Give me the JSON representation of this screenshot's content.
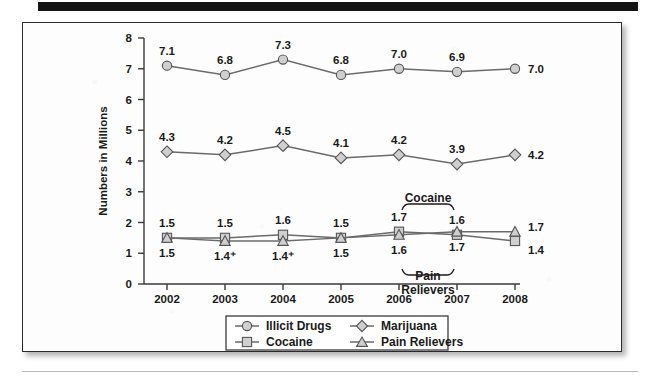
{
  "figure": {
    "alt_name": "drug-use-line-chart"
  },
  "chart_data": {
    "type": "line",
    "title": "",
    "xlabel": "",
    "ylabel": "Numbers in Millions",
    "categories": [
      "2002",
      "2003",
      "2004",
      "2005",
      "2006",
      "2007",
      "2008"
    ],
    "ylim": [
      0,
      8
    ],
    "yticks": [
      "0",
      "1",
      "2",
      "3",
      "4",
      "5",
      "6",
      "7",
      "8"
    ],
    "grid": false,
    "legend_position": "bottom",
    "series": [
      {
        "name": "Illicit Drugs",
        "marker": "circle",
        "values": [
          7.1,
          6.8,
          7.3,
          6.8,
          7.0,
          6.9,
          7.0
        ],
        "labels": [
          "7.1",
          "6.8",
          "7.3",
          "6.8",
          "7.0",
          "6.9",
          "7.0"
        ],
        "label_position": "above",
        "last_label_outside": "7.0"
      },
      {
        "name": "Marijuana",
        "marker": "diamond",
        "values": [
          4.3,
          4.2,
          4.5,
          4.1,
          4.2,
          3.9,
          4.2
        ],
        "labels": [
          "4.3",
          "4.2",
          "4.5",
          "4.1",
          "4.2",
          "3.9",
          "4.2"
        ],
        "label_position": "above",
        "last_label_outside": "4.2"
      },
      {
        "name": "Cocaine",
        "marker": "square",
        "values": [
          1.5,
          1.5,
          1.6,
          1.5,
          1.7,
          1.6,
          1.4
        ],
        "labels": [
          "1.5",
          "1.5",
          "1.6",
          "1.5",
          "1.7",
          "1.6",
          "1.4"
        ],
        "label_position": "above",
        "last_label_outside": "1.4"
      },
      {
        "name": "Pain Relievers",
        "marker": "triangle",
        "values": [
          1.5,
          1.4,
          1.4,
          1.5,
          1.6,
          1.7,
          1.7
        ],
        "labels": [
          "1.5",
          "1.4⁺",
          "1.4⁺",
          "1.5",
          "1.6",
          "1.7",
          "1.7"
        ],
        "label_position": "below",
        "last_label_outside": "1.7"
      }
    ],
    "annotations": [
      {
        "text": "Cocaine",
        "position": "above-bracket",
        "spans_years": [
          "2006",
          "2007"
        ]
      },
      {
        "text": "Pain",
        "position": "below-bracket",
        "spans_years": [
          "2006",
          "2007"
        ]
      },
      {
        "text": "Relievers",
        "position": "below-bracket-second-line",
        "spans_years": [
          "2006",
          "2007"
        ]
      }
    ],
    "colors": {
      "marker_fill": "#cfcfcf",
      "marker_stroke": "#555555",
      "line": "#6a6a6a",
      "axis": "#3a3a3a",
      "text": "#1a1a1a",
      "background": "#fdfdfd"
    }
  },
  "legend": {
    "entries": [
      {
        "label": "Illicit Drugs",
        "marker": "circle"
      },
      {
        "label": "Marijuana",
        "marker": "diamond"
      },
      {
        "label": "Cocaine",
        "marker": "square"
      },
      {
        "label": "Pain Relievers",
        "marker": "triangle"
      }
    ]
  }
}
